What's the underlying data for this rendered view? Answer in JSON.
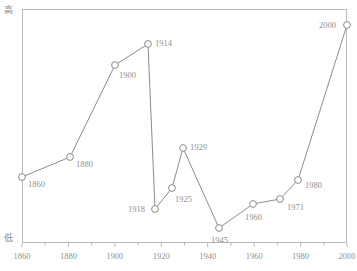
{
  "chart_data": {
    "type": "line",
    "title": "",
    "xlabel": "",
    "ylabel": "",
    "y_axis_top_label": "高",
    "y_axis_bottom_label": "低",
    "grid": false,
    "legend": "none",
    "xlim": [
      1860,
      2000
    ],
    "ylim": [
      0,
      100
    ],
    "xticks": [
      "1860",
      "1880",
      "1900",
      "1920",
      "1940",
      "1960",
      "1980",
      "2000"
    ],
    "series_name": "trend",
    "points": [
      {
        "label": "1860",
        "x": 1860,
        "y": 28,
        "px": 22,
        "py": 177,
        "label_dx": 6,
        "label_dy": 3
      },
      {
        "label": "1880",
        "x": 1880,
        "y": 37,
        "px": 70,
        "py": 157,
        "label_dx": 6,
        "label_dy": 3
      },
      {
        "label": "1900",
        "x": 1900,
        "y": 76,
        "px": 115,
        "py": 65,
        "label_dx": 4,
        "label_dy": 6
      },
      {
        "label": "1914",
        "x": 1914,
        "y": 85,
        "px": 148,
        "py": 44,
        "label_dx": 7,
        "label_dy": -5
      },
      {
        "label": "1918",
        "x": 1918,
        "y": 15,
        "px": 155,
        "py": 209,
        "label_dx": -27,
        "label_dy": -4
      },
      {
        "label": "1925",
        "x": 1925,
        "y": 24,
        "px": 172,
        "py": 188,
        "label_dx": 3,
        "label_dy": 7
      },
      {
        "label": "1929",
        "x": 1929,
        "y": 41,
        "px": 183,
        "py": 148,
        "label_dx": 7,
        "label_dy": -5
      },
      {
        "label": "1945",
        "x": 1945,
        "y": 7,
        "px": 219,
        "py": 228,
        "label_dx": -8,
        "label_dy": 8
      },
      {
        "label": "1960",
        "x": 1960,
        "y": 17,
        "px": 253,
        "py": 204,
        "label_dx": -8,
        "label_dy": 9
      },
      {
        "label": "1971",
        "x": 1971,
        "y": 19,
        "px": 280,
        "py": 199,
        "label_dx": 7,
        "label_dy": 4
      },
      {
        "label": "1980",
        "x": 1980,
        "y": 27,
        "px": 298,
        "py": 180,
        "label_dx": 7,
        "label_dy": 1
      },
      {
        "label": "2000",
        "x": 2000,
        "y": 93,
        "px": 347,
        "py": 25,
        "label_dx": -28,
        "label_dy": -4
      }
    ],
    "colors": {
      "line": "#8c8c8c",
      "marker_stroke": "#8c8c8c",
      "marker_fill": "#ffffff",
      "axis": "#b9b9b9",
      "text": "#8f8f8f"
    }
  }
}
